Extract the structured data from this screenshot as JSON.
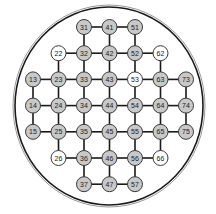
{
  "diagram": {
    "type": "grid-in-circle",
    "colors": {
      "filled_node": "#c8c8c8",
      "empty_node": "#ffffff",
      "edge": "#1a1a1a",
      "outline": "#1a1a1a",
      "outline_inner": "#9a9a9a"
    },
    "columns": [
      1,
      2,
      3,
      4,
      5,
      6,
      7
    ],
    "rows": [
      1,
      2,
      3,
      4,
      5,
      6,
      7
    ],
    "nodes": [
      {
        "id": "31",
        "col": 3,
        "row": 1,
        "filled": true
      },
      {
        "id": "41",
        "col": 4,
        "row": 1,
        "filled": true
      },
      {
        "id": "51",
        "col": 5,
        "row": 1,
        "filled": true
      },
      {
        "id": "22",
        "col": 2,
        "row": 2,
        "filled": false
      },
      {
        "id": "32",
        "col": 3,
        "row": 2,
        "filled": true
      },
      {
        "id": "42",
        "col": 4,
        "row": 2,
        "filled": true
      },
      {
        "id": "52",
        "col": 5,
        "row": 2,
        "filled": true
      },
      {
        "id": "62",
        "col": 6,
        "row": 2,
        "filled": false
      },
      {
        "id": "13",
        "col": 1,
        "row": 3,
        "filled": true
      },
      {
        "id": "23",
        "col": 2,
        "row": 3,
        "filled": true
      },
      {
        "id": "33",
        "col": 3,
        "row": 3,
        "filled": true
      },
      {
        "id": "43",
        "col": 4,
        "row": 3,
        "filled": true
      },
      {
        "id": "53",
        "col": 5,
        "row": 3,
        "filled": false
      },
      {
        "id": "63",
        "col": 6,
        "row": 3,
        "filled": true
      },
      {
        "id": "73",
        "col": 7,
        "row": 3,
        "filled": true
      },
      {
        "id": "14",
        "col": 1,
        "row": 4,
        "filled": true
      },
      {
        "id": "24",
        "col": 2,
        "row": 4,
        "filled": true
      },
      {
        "id": "34",
        "col": 3,
        "row": 4,
        "filled": true
      },
      {
        "id": "44",
        "col": 4,
        "row": 4,
        "filled": true
      },
      {
        "id": "54",
        "col": 5,
        "row": 4,
        "filled": true
      },
      {
        "id": "64",
        "col": 6,
        "row": 4,
        "filled": true
      },
      {
        "id": "74",
        "col": 7,
        "row": 4,
        "filled": true
      },
      {
        "id": "15",
        "col": 1,
        "row": 5,
        "filled": true
      },
      {
        "id": "25",
        "col": 2,
        "row": 5,
        "filled": true
      },
      {
        "id": "35",
        "col": 3,
        "row": 5,
        "filled": true
      },
      {
        "id": "45",
        "col": 4,
        "row": 5,
        "filled": true
      },
      {
        "id": "55",
        "col": 5,
        "row": 5,
        "filled": true
      },
      {
        "id": "65",
        "col": 6,
        "row": 5,
        "filled": true
      },
      {
        "id": "75",
        "col": 7,
        "row": 5,
        "filled": true
      },
      {
        "id": "26",
        "col": 2,
        "row": 6,
        "filled": false
      },
      {
        "id": "36",
        "col": 3,
        "row": 6,
        "filled": true
      },
      {
        "id": "46",
        "col": 4,
        "row": 6,
        "filled": true
      },
      {
        "id": "56",
        "col": 5,
        "row": 6,
        "filled": true
      },
      {
        "id": "66",
        "col": 6,
        "row": 6,
        "filled": false
      },
      {
        "id": "37",
        "col": 3,
        "row": 7,
        "filled": true
      },
      {
        "id": "47",
        "col": 4,
        "row": 7,
        "filled": true
      },
      {
        "id": "57",
        "col": 5,
        "row": 7,
        "filled": true
      }
    ],
    "edges": [
      [
        "31",
        "41"
      ],
      [
        "41",
        "51"
      ],
      [
        "22",
        "32"
      ],
      [
        "32",
        "42"
      ],
      [
        "42",
        "52"
      ],
      [
        "52",
        "62"
      ],
      [
        "13",
        "23"
      ],
      [
        "23",
        "33"
      ],
      [
        "33",
        "43"
      ],
      [
        "43",
        "53"
      ],
      [
        "53",
        "63"
      ],
      [
        "63",
        "73"
      ],
      [
        "14",
        "24"
      ],
      [
        "24",
        "34"
      ],
      [
        "34",
        "44"
      ],
      [
        "44",
        "54"
      ],
      [
        "54",
        "64"
      ],
      [
        "64",
        "74"
      ],
      [
        "15",
        "25"
      ],
      [
        "25",
        "35"
      ],
      [
        "35",
        "45"
      ],
      [
        "45",
        "55"
      ],
      [
        "55",
        "65"
      ],
      [
        "65",
        "75"
      ],
      [
        "26",
        "36"
      ],
      [
        "36",
        "46"
      ],
      [
        "46",
        "56"
      ],
      [
        "56",
        "66"
      ],
      [
        "37",
        "47"
      ],
      [
        "47",
        "57"
      ],
      [
        "31",
        "32"
      ],
      [
        "32",
        "33"
      ],
      [
        "33",
        "34"
      ],
      [
        "34",
        "35"
      ],
      [
        "35",
        "36"
      ],
      [
        "36",
        "37"
      ],
      [
        "41",
        "42"
      ],
      [
        "42",
        "43"
      ],
      [
        "43",
        "44"
      ],
      [
        "44",
        "45"
      ],
      [
        "45",
        "46"
      ],
      [
        "46",
        "47"
      ],
      [
        "51",
        "52"
      ],
      [
        "52",
        "53"
      ],
      [
        "53",
        "54"
      ],
      [
        "54",
        "55"
      ],
      [
        "55",
        "56"
      ],
      [
        "56",
        "57"
      ],
      [
        "22",
        "23"
      ],
      [
        "23",
        "24"
      ],
      [
        "24",
        "25"
      ],
      [
        "25",
        "26"
      ],
      [
        "62",
        "63"
      ],
      [
        "63",
        "64"
      ],
      [
        "64",
        "65"
      ],
      [
        "65",
        "66"
      ],
      [
        "13",
        "14"
      ],
      [
        "14",
        "15"
      ],
      [
        "73",
        "74"
      ],
      [
        "74",
        "75"
      ]
    ]
  }
}
